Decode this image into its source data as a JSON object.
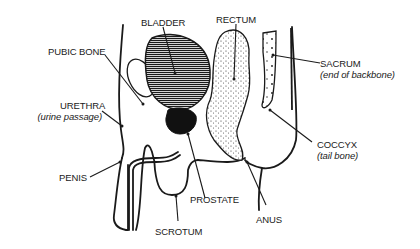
{
  "diagram": {
    "labels": {
      "bladder": "BLADDER",
      "rectum": "RECTUM",
      "pubic_bone": "PUBIC BONE",
      "sacrum": "SACRUM",
      "sacrum_note": "(end of backbone)",
      "urethra": "URETHRA",
      "urethra_note": "(urine passage)",
      "coccyx": "COCCYX",
      "coccyx_note": "(tail bone)",
      "penis": "PENIS",
      "prostate": "PROSTATE",
      "anus": "ANUS",
      "scrotum": "SCROTUM"
    },
    "colors": {
      "ink": "#1a1a1a",
      "background": "#ffffff"
    }
  }
}
